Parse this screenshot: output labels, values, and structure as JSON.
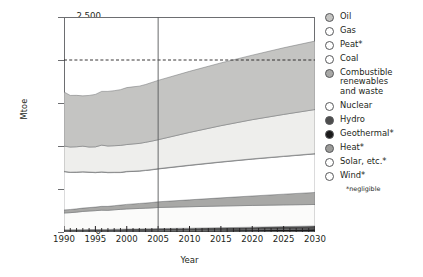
{
  "chart_data": {
    "type": "area",
    "stacked": true,
    "title": "",
    "xlabel": "Year",
    "ylabel": "Mtoe",
    "xlim": [
      1990,
      2030
    ],
    "ylim": [
      0,
      2500
    ],
    "ytick_labels": [
      "0",
      "500",
      "1,000",
      "1,500",
      "2,000",
      "2,500"
    ],
    "ytick_values": [
      0,
      500,
      1000,
      1500,
      2000,
      2500
    ],
    "xtick_labels": [
      "1990",
      "1995",
      "2000",
      "2005",
      "2010",
      "2015",
      "2020",
      "2025",
      "2030"
    ],
    "xtick_values": [
      1990,
      1995,
      2000,
      2005,
      2010,
      2015,
      2020,
      2025,
      2030
    ],
    "minor_xticks": "annual",
    "grid": false,
    "reference_line": {
      "value": 2000,
      "style": "dashed",
      "label": ""
    },
    "divider_line": {
      "value": 2005,
      "style": "solid",
      "label": ""
    },
    "legend_position": "right",
    "x": [
      1990,
      1991,
      1992,
      1993,
      1994,
      1995,
      1996,
      1997,
      1998,
      1999,
      2000,
      2001,
      2002,
      2003,
      2004,
      2005,
      2010,
      2015,
      2020,
      2025,
      2030
    ],
    "series": [
      {
        "name": "Wind*",
        "color": "#f2f2f0",
        "values": [
          0,
          0,
          0,
          0,
          0,
          0,
          0,
          0,
          0,
          0,
          0,
          0,
          0,
          0,
          0,
          0,
          0,
          0,
          0,
          0,
          0
        ]
      },
      {
        "name": "Solar, etc.*",
        "color": "#f2f2f0",
        "values": [
          1,
          1,
          1,
          1,
          1,
          1,
          1,
          1,
          2,
          2,
          2,
          2,
          2,
          2,
          2,
          3,
          3,
          4,
          5,
          6,
          7
        ]
      },
      {
        "name": "Geothermal*",
        "color": "#1a1a1a",
        "values": [
          6,
          6,
          6,
          7,
          7,
          7,
          8,
          8,
          8,
          9,
          9,
          10,
          10,
          11,
          11,
          12,
          14,
          17,
          20,
          24,
          28
        ]
      },
      {
        "name": "Hydro",
        "color": "#4d4d4d",
        "values": [
          18,
          18,
          19,
          19,
          20,
          20,
          21,
          21,
          22,
          22,
          23,
          23,
          24,
          24,
          25,
          25,
          27,
          29,
          31,
          33,
          35
        ]
      },
      {
        "name": "Nuclear",
        "color": "#fbfbfa",
        "values": [
          196,
          200,
          205,
          212,
          216,
          220,
          224,
          222,
          226,
          230,
          234,
          236,
          238,
          240,
          242,
          245,
          250,
          252,
          253,
          252,
          250
        ]
      },
      {
        "name": "Combustible renewables and waste",
        "color": "#a8a8a6",
        "values": [
          36,
          37,
          38,
          39,
          40,
          42,
          44,
          46,
          48,
          50,
          53,
          55,
          58,
          60,
          63,
          66,
          80,
          95,
          110,
          125,
          140
        ]
      },
      {
        "name": "Coal",
        "color": "#ffffff",
        "values": [
          445,
          430,
          425,
          420,
          410,
          400,
          398,
          392,
          385,
          378,
          380,
          378,
          376,
          378,
          380,
          382,
          400,
          415,
          428,
          438,
          448
        ]
      },
      {
        "name": "Peat*",
        "color": "#fcfcfb",
        "values": [
          4,
          4,
          4,
          4,
          4,
          4,
          4,
          4,
          4,
          4,
          4,
          4,
          4,
          4,
          4,
          4,
          4,
          4,
          4,
          4,
          4
        ]
      },
      {
        "name": "Gas",
        "color": "#eeeeec",
        "values": [
          293,
          292,
          293,
          296,
          290,
          296,
          310,
          306,
          308,
          312,
          312,
          316,
          318,
          324,
          330,
          336,
          380,
          420,
          455,
          485,
          512
        ]
      },
      {
        "name": "Oil",
        "color": "#c4c4c2",
        "values": [
          630,
          600,
          598,
          585,
          600,
          610,
          625,
          635,
          640,
          648,
          662,
          664,
          666,
          672,
          682,
          690,
          710,
          730,
          750,
          775,
          796
        ]
      }
    ],
    "cumulative_totals": [
      1629,
      1588,
      1589,
      1583,
      1588,
      1600,
      1635,
      1635,
      1643,
      1655,
      1679,
      1684,
      1696,
      1713,
      1739,
      1763,
      1868,
      1966,
      2056,
      2142,
      2220
    ],
    "notes": "*negligible"
  },
  "legend": {
    "items": [
      {
        "label": "Oil",
        "marker": "filled-circle-midgray",
        "color": "#c4c4c2",
        "gap": false
      },
      {
        "label": "Gas",
        "marker": "open-circle",
        "color": "#ffffff",
        "gap": false
      },
      {
        "label": "Peat*",
        "marker": "open-circle",
        "color": "#ffffff",
        "gap": false
      },
      {
        "label": "Coal",
        "marker": "open-circle",
        "color": "#ffffff",
        "gap": false
      },
      {
        "label": "Combustible\nrenewables\nand waste",
        "marker": "filled-circle-gray",
        "color": "#a8a8a6",
        "gap": false
      },
      {
        "label": "Nuclear",
        "marker": "open-circle",
        "color": "#ffffff",
        "gap": true
      },
      {
        "label": "Hydro",
        "marker": "filled-circle-darkgray",
        "color": "#4d4d4d",
        "gap": false
      },
      {
        "label": "Geothermal*",
        "marker": "filled-circle-black",
        "color": "#1a1a1a",
        "gap": false
      },
      {
        "label": "Heat*",
        "marker": "filled-circle-midgray",
        "color": "#9b9b99",
        "gap": false
      },
      {
        "label": "Solar, etc.*",
        "marker": "open-circle",
        "color": "#ffffff",
        "gap": false
      },
      {
        "label": "Wind*",
        "marker": "open-circle",
        "color": "#ffffff",
        "gap": false
      }
    ],
    "footnote": "*negligible"
  },
  "colors": {
    "axis": "#6d6e71",
    "text": "#231f20",
    "oil": "#c4c4c2",
    "gas": "#eeeeec",
    "coal": "#ffffff",
    "crw": "#a8a8a6",
    "nuclear": "#fbfbfa",
    "hydro": "#4d4d4d",
    "geothermal": "#1a1a1a"
  }
}
